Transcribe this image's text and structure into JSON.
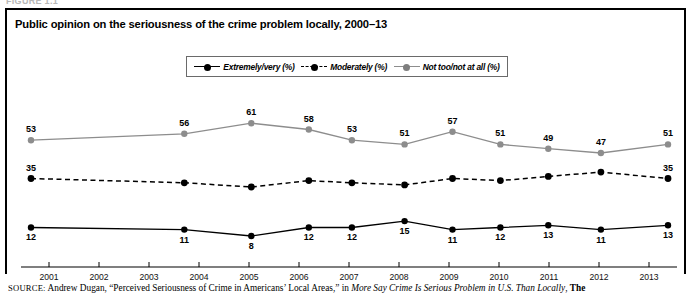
{
  "figure": {
    "label": "FIGURE 1.1"
  },
  "chart_title": "Public opinion on the seriousness of the crime problem locally, 2000–13",
  "legend": {
    "items": [
      {
        "label": "Extremely/very (%)",
        "style": "solid-dark",
        "marker": "dark"
      },
      {
        "label": "Moderately (%)",
        "style": "dashed-dark",
        "marker": "dark"
      },
      {
        "label": "Not too/not at all (%)",
        "style": "solid-gray",
        "marker": "gray"
      }
    ]
  },
  "source": {
    "kicker": "SOURCE:",
    "text_1": " Andrew Dugan, “Perceived Seriousness of Crime in Americans’ Local Areas,” in ",
    "italic": "More Say Crime Is Serious Problem in U.S. Than Locally",
    "text_2": ", ",
    "tail": "The"
  },
  "chart_data": {
    "type": "line",
    "title": "Public opinion on the seriousness of the crime problem locally, 2000–13",
    "xlabel": "",
    "ylabel": "",
    "grid": false,
    "legend_position": "top-center",
    "x_tick_labels": [
      "2001",
      "2002",
      "2003",
      "2004",
      "2005",
      "2006",
      "2007",
      "2008",
      "2009",
      "2010",
      "2011",
      "2012",
      "2013"
    ],
    "x": [
      2000,
      2003.2,
      2004.6,
      2005.8,
      2006.7,
      2007.8,
      2008.8,
      2009.8,
      2010.8,
      2011.9,
      2013.3
    ],
    "ylim": [
      0,
      70
    ],
    "series": [
      {
        "name": "Not too/not at all (%)",
        "color": "#8d8d8d",
        "style": "solid",
        "values": [
          53,
          56,
          61,
          58,
          53,
          51,
          57,
          51,
          49,
          47,
          51
        ],
        "labels": [
          "53",
          "56",
          "61",
          "58",
          "53",
          "51",
          "57",
          "51",
          "49",
          "47",
          "51"
        ]
      },
      {
        "name": "Moderately (%)",
        "color": "#000000",
        "style": "dashed",
        "values": [
          35,
          33,
          31,
          34,
          33,
          32,
          35,
          34,
          36,
          38,
          35
        ],
        "labels": [
          "35",
          "",
          "",
          "",
          "",
          "",
          "",
          "",
          "",
          "",
          "35"
        ]
      },
      {
        "name": "Extremely/very (%)",
        "color": "#000000",
        "style": "solid",
        "values": [
          12,
          11,
          8,
          12,
          12,
          15,
          11,
          12,
          13,
          11,
          13
        ],
        "labels": [
          "12",
          "11",
          "8",
          "12",
          "12",
          "15",
          "11",
          "12",
          "13",
          "11",
          "13"
        ]
      }
    ]
  }
}
